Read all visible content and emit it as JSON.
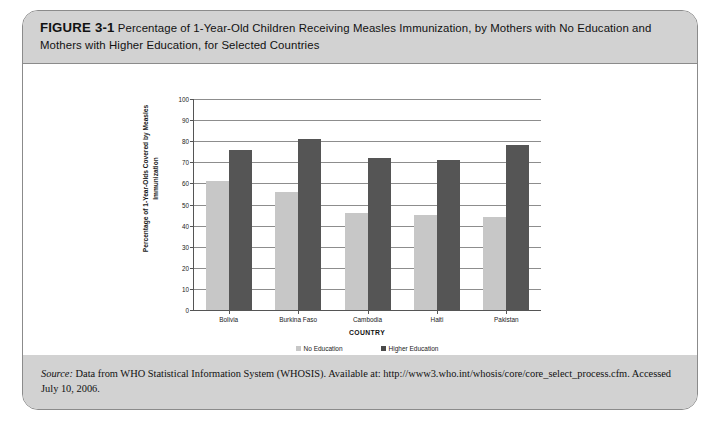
{
  "figure": {
    "label": "FIGURE 3-1",
    "caption": "Percentage of 1-Year-Old Children Receiving Measles Immunization, by Mothers with No Education and Mothers with Higher Education, for Selected Countries",
    "source_prefix": "Source:",
    "source_text": " Data from WHO Statistical Information System (WHOSIS). Available at: http://www3.who.int/whosis/core/core_select_process.cfm. Accessed July 10, 2006."
  },
  "chart_data": {
    "type": "bar",
    "title": "",
    "xlabel": "COUNTRY",
    "ylabel": "Percentage of 1-Year-Olds Covered by Measles Immunization",
    "categories": [
      "Bolivia",
      "Burkina Faso",
      "Cambodia",
      "Haiti",
      "Pakistan"
    ],
    "series": [
      {
        "name": "No Education",
        "color": "#c7c7c7",
        "values": [
          61,
          56,
          46,
          45,
          44
        ]
      },
      {
        "name": "Higher Education",
        "color": "#555555",
        "values": [
          76,
          81,
          72,
          71,
          78
        ]
      }
    ],
    "ylim": [
      0,
      100
    ],
    "yticks": [
      0,
      10,
      20,
      30,
      40,
      50,
      60,
      70,
      80,
      90,
      100
    ],
    "grid": true,
    "legend_position": "bottom"
  }
}
